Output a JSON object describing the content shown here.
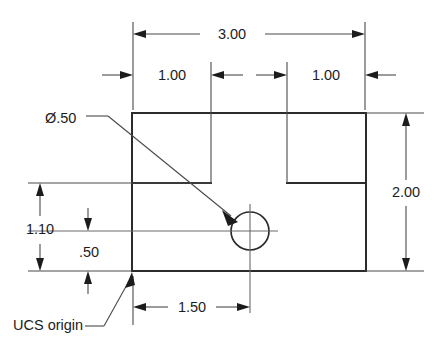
{
  "drawing": {
    "title": "Rectangular plate with hole - dimensioned orthographic view",
    "units_note": "",
    "colors": {
      "outline": "#2b2b2b",
      "dimension": "#4a4a4a",
      "centerline": "#6a6a6a",
      "text": "#1c1c1c",
      "background": "#ffffff"
    },
    "dimensions": [
      {
        "id": "overall-width",
        "label": "3.00",
        "orientation": "horizontal",
        "position": "top",
        "measures": "overall plate width"
      },
      {
        "id": "left-offset",
        "label": "1.00",
        "orientation": "horizontal",
        "position": "top-inner-left",
        "measures": "left internal feature offset"
      },
      {
        "id": "right-offset",
        "label": "1.00",
        "orientation": "horizontal",
        "position": "top-inner-right",
        "measures": "right internal feature offset"
      },
      {
        "id": "overall-height",
        "label": "2.00",
        "orientation": "vertical",
        "position": "right",
        "measures": "overall plate height"
      },
      {
        "id": "hole-height",
        "label": "1.10",
        "orientation": "vertical",
        "position": "left",
        "measures": "height from bottom edge to hole centerline"
      },
      {
        "id": "lower-offset",
        "label": ".50",
        "orientation": "vertical",
        "position": "left-inner",
        "measures": "lower internal offset"
      },
      {
        "id": "hole-x-position",
        "label": "1.50",
        "orientation": "horizontal",
        "position": "bottom",
        "measures": "horizontal distance from origin to hole center"
      }
    ],
    "annotations": [
      {
        "id": "hole-diameter-callout",
        "label": "Ø.50",
        "kind": "leader-note",
        "points_to": "hole"
      },
      {
        "id": "ucs-origin-callout",
        "label": "UCS origin",
        "kind": "leader-note",
        "points_to": "bottom-left-corner"
      }
    ]
  }
}
